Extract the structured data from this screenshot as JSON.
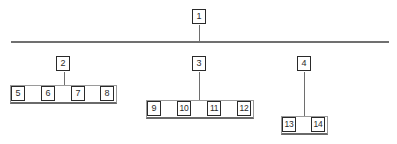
{
  "diagram": {
    "type": "hierarchy",
    "root": {
      "label": "1",
      "children": [
        {
          "label": "2",
          "children": [
            "5",
            "6",
            "7",
            "8"
          ]
        },
        {
          "label": "3",
          "children": [
            "9",
            "10",
            "11",
            "12"
          ]
        },
        {
          "label": "4",
          "children": [
            "13",
            "14"
          ]
        }
      ]
    },
    "nodes": {
      "n1": "1",
      "n2": "2",
      "n3": "3",
      "n4": "4",
      "n5": "5",
      "n6": "6",
      "n7": "7",
      "n8": "8",
      "n9": "9",
      "n10": "10",
      "n11": "11",
      "n12": "12",
      "n13": "13",
      "n14": "14"
    }
  }
}
